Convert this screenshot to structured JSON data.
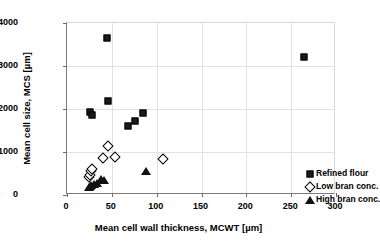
{
  "chart_data": {
    "type": "scatter",
    "title": "",
    "xlabel": "Mean cell wall thickness, MCWT [µm]",
    "ylabel": "Mean cell size, MCS [µm]",
    "xlim": [
      0,
      300
    ],
    "ylim": [
      0,
      4000
    ],
    "xticks": [
      0,
      50,
      100,
      150,
      200,
      250,
      300
    ],
    "yticks": [
      0,
      1000,
      2000,
      3000,
      4000
    ],
    "xtick_labels": [
      "0",
      "50",
      "100",
      "150",
      "200",
      "250",
      "300"
    ],
    "ytick_labels": [
      "0",
      "1000",
      "2000",
      "3000",
      "4000"
    ],
    "grid": true,
    "legend_position": "center right",
    "series": [
      {
        "name": "Refined flour",
        "marker": "filled-square",
        "color": "#1a1a1a",
        "points": [
          {
            "x": 26,
            "y": 1940
          },
          {
            "x": 28,
            "y": 1860
          },
          {
            "x": 45,
            "y": 3650
          },
          {
            "x": 46,
            "y": 2180
          },
          {
            "x": 68,
            "y": 1610
          },
          {
            "x": 76,
            "y": 1720
          },
          {
            "x": 85,
            "y": 1900
          },
          {
            "x": 264,
            "y": 3220
          }
        ]
      },
      {
        "name": "Low bran conc.",
        "marker": "open-diamond",
        "color": "#000000",
        "points": [
          {
            "x": 25,
            "y": 420
          },
          {
            "x": 26,
            "y": 470
          },
          {
            "x": 27,
            "y": 560
          },
          {
            "x": 28,
            "y": 610
          },
          {
            "x": 40,
            "y": 850
          },
          {
            "x": 46,
            "y": 1130
          },
          {
            "x": 54,
            "y": 890
          },
          {
            "x": 107,
            "y": 830
          }
        ]
      },
      {
        "name": "High bran conc.",
        "marker": "filled-triangle",
        "color": "#111111",
        "points": [
          {
            "x": 24,
            "y": 180
          },
          {
            "x": 26,
            "y": 200
          },
          {
            "x": 27,
            "y": 230
          },
          {
            "x": 30,
            "y": 250
          },
          {
            "x": 33,
            "y": 270
          },
          {
            "x": 38,
            "y": 380
          },
          {
            "x": 41,
            "y": 350
          },
          {
            "x": 88,
            "y": 560
          }
        ]
      }
    ]
  }
}
